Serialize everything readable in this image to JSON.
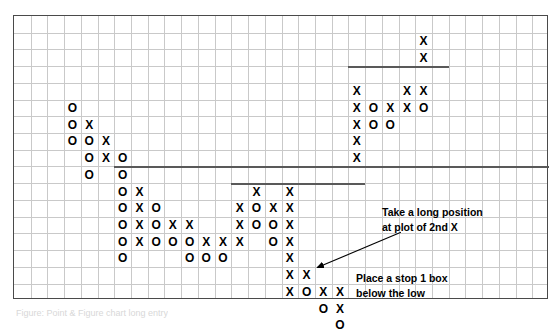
{
  "chart_data": {
    "type": "table",
    "subtitle": "",
    "xlabel": "",
    "ylabel": "",
    "grid": {
      "columns": 32,
      "rows": 17,
      "cell_px": 16.72,
      "grid_on": true
    },
    "legend_position": "none",
    "notation": {
      "up_mark": "X",
      "down_mark": "O"
    },
    "columns": [
      {
        "col": 3,
        "mark": "O",
        "rows": [
          5,
          6,
          7
        ]
      },
      {
        "col": 4,
        "mark": "X",
        "rows": [
          6
        ]
      },
      {
        "col": 4,
        "mark": "O",
        "rows": [
          7,
          8,
          9
        ]
      },
      {
        "col": 5,
        "mark": "X",
        "rows": [
          7,
          8
        ]
      },
      {
        "col": 6,
        "mark": "O",
        "rows": [
          8,
          9,
          10,
          11,
          12,
          13,
          14
        ]
      },
      {
        "col": 7,
        "mark": "X",
        "rows": [
          10,
          11,
          12,
          13
        ]
      },
      {
        "col": 8,
        "mark": "O",
        "rows": [
          11,
          12,
          13
        ]
      },
      {
        "col": 9,
        "mark": "X",
        "rows": [
          12
        ]
      },
      {
        "col": 9,
        "mark": "O",
        "rows": [
          13
        ]
      },
      {
        "col": 10,
        "mark": "X",
        "rows": [
          12
        ]
      },
      {
        "col": 10,
        "mark": "O",
        "rows": [
          13,
          14
        ]
      },
      {
        "col": 11,
        "mark": "X",
        "rows": [
          13
        ]
      },
      {
        "col": 11,
        "mark": "O",
        "rows": [
          14
        ]
      },
      {
        "col": 12,
        "mark": "X",
        "rows": [
          13
        ]
      },
      {
        "col": 12,
        "mark": "O",
        "rows": [
          14
        ]
      },
      {
        "col": 13,
        "mark": "X",
        "rows": [
          11,
          12,
          13
        ]
      },
      {
        "col": 14,
        "mark": "X",
        "rows": [
          10
        ]
      },
      {
        "col": 14,
        "mark": "O",
        "rows": [
          11,
          12
        ]
      },
      {
        "col": 15,
        "mark": "X",
        "rows": [
          11
        ]
      },
      {
        "col": 15,
        "mark": "O",
        "rows": [
          12,
          13
        ]
      },
      {
        "col": 16,
        "mark": "X",
        "rows": [
          10,
          11,
          12,
          13,
          14,
          15,
          16
        ]
      },
      {
        "col": 17,
        "mark": "X",
        "rows": [
          15
        ]
      },
      {
        "col": 17,
        "mark": "O",
        "rows": [
          16
        ]
      },
      {
        "col": 18,
        "mark": "X",
        "rows": [
          16
        ]
      },
      {
        "col": 18,
        "mark": "O",
        "rows": [
          17
        ]
      },
      {
        "col": 19,
        "mark": "X",
        "rows": [
          16,
          17
        ]
      },
      {
        "col": 19,
        "mark": "O",
        "rows": [
          18
        ]
      },
      {
        "col": 20,
        "mark": "X",
        "rows": [
          4,
          5,
          6,
          7,
          8
        ]
      },
      {
        "col": 21,
        "mark": "O",
        "rows": [
          5,
          6
        ]
      },
      {
        "col": 22,
        "mark": "X",
        "rows": [
          5
        ]
      },
      {
        "col": 22,
        "mark": "O",
        "rows": [
          6
        ]
      },
      {
        "col": 23,
        "mark": "X",
        "rows": [
          4,
          5
        ]
      },
      {
        "col": 24,
        "mark": "X",
        "rows": [
          1,
          2,
          4
        ]
      },
      {
        "col": 24,
        "mark": "O",
        "rows": [
          5
        ]
      }
    ],
    "trend_lines": [
      {
        "id": "support-line-low",
        "x_start_col": 6,
        "x_end_col": 32,
        "row": 9
      },
      {
        "id": "support-line-mid",
        "x_start_col": 13,
        "x_end_col": 21,
        "row": 10
      },
      {
        "id": "support-line-high",
        "x_start_col": 20,
        "x_end_col": 26,
        "row": 3
      }
    ],
    "annotations": [
      {
        "id": "long-entry-note",
        "line1": "Take a long position",
        "line2": "at plot of 2nd X",
        "arrow": {
          "from_col": 23.2,
          "from_row": 13.0,
          "to_col": 18.2,
          "to_row": 15.1
        }
      },
      {
        "id": "stop-loss-note",
        "line1": "Place a stop 1 box",
        "line2": "below the low",
        "arrow": {
          "from_col": 21.2,
          "from_row": 18.6,
          "to_col": 18.3,
          "to_row": 18.6
        }
      }
    ]
  },
  "colors": {
    "grid_line": "#c9c9c9",
    "frame": "#4a4a4a",
    "trend_line": "#595959",
    "mark": "#000000",
    "annotation_text": "#000000",
    "background": "#ffffff"
  },
  "caption": {
    "text": "Figure: Point & Figure chart long entry"
  }
}
